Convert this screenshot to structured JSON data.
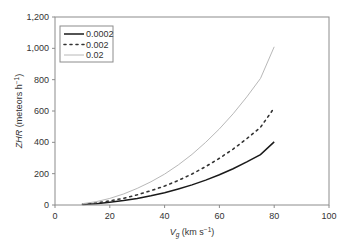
{
  "chart_data": {
    "type": "line",
    "title": "",
    "xlabel": "Vg (km s⁻¹)",
    "xlabel_parts": {
      "var": "V",
      "sub": "g",
      "unit": " (km s",
      "sup": "−1",
      "close": ")"
    },
    "ylabel": "ZHR (meteors h⁻¹)",
    "ylabel_parts": {
      "var": "ZHR",
      "unit": " (meteors h",
      "sup": "−1",
      "close": ")"
    },
    "xlim": [
      0,
      100
    ],
    "ylim": [
      0,
      1200
    ],
    "x_ticks": [
      0,
      20,
      40,
      60,
      80,
      100
    ],
    "y_ticks": [
      0,
      200,
      400,
      600,
      800,
      1000,
      1200
    ],
    "y_tick_labels": [
      "0",
      "200",
      "400",
      "600",
      "800",
      "1,000",
      "1,200"
    ],
    "grid": false,
    "legend_position": "upper left",
    "x": [
      10,
      15,
      20,
      25,
      30,
      35,
      40,
      45,
      50,
      55,
      60,
      65,
      70,
      75,
      80
    ],
    "series": [
      {
        "name": "0.0002",
        "style": "solid",
        "color": "#1a1a1a",
        "values": [
          3,
          8,
          17,
          28,
          42,
          59,
          78,
          102,
          128,
          159,
          193,
          232,
          275,
          322,
          403
        ]
      },
      {
        "name": "0.002",
        "style": "dotted",
        "color": "#333333",
        "values": [
          5,
          13,
          26,
          43,
          65,
          91,
          121,
          157,
          198,
          245,
          298,
          357,
          423,
          496,
          620
        ]
      },
      {
        "name": "0.02",
        "style": "solid-light",
        "color": "#b8b8b8",
        "values": [
          8,
          21,
          42,
          70,
          106,
          148,
          197,
          256,
          323,
          400,
          486,
          582,
          690,
          808,
          1010
        ]
      }
    ]
  }
}
